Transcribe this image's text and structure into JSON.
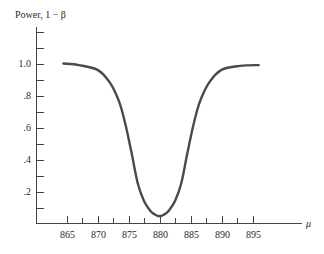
{
  "chart_data": {
    "type": "line",
    "title": "",
    "xlabel": "μ",
    "ylabel": "Power, 1 − β",
    "xlim": [
      860,
      902
    ],
    "ylim": [
      0,
      1.2
    ],
    "grid": false,
    "legend": null,
    "x_ticks": [
      865,
      870,
      875,
      880,
      885,
      890,
      895
    ],
    "x_tick_labels": [
      "865",
      "870",
      "875",
      "880",
      "885",
      "890",
      "895"
    ],
    "x_minor_ticks": [
      867.5,
      872.5,
      877.5,
      882.5,
      887.5,
      892.5
    ],
    "y_ticks": [
      0.1,
      0.2,
      0.3,
      0.4,
      0.5,
      0.6,
      0.7,
      0.8,
      0.9,
      1.0,
      1.1,
      1.2
    ],
    "y_tick_labels": [
      ".2",
      ".4",
      ".6",
      ".8",
      "1.0"
    ],
    "y_tick_label_values": [
      0.2,
      0.4,
      0.6,
      0.8,
      1.0
    ],
    "series": [
      {
        "name": "Power curve",
        "x": [
          864.5,
          867,
          870,
          872,
          873.5,
          874.5,
          875.5,
          876.5,
          877.5,
          878.5,
          879.3,
          880,
          880.7,
          881.5,
          882.5,
          883.5,
          884.5,
          885.5,
          886.5,
          888,
          890,
          893,
          896
        ],
        "y": [
          1.0,
          0.99,
          0.96,
          0.88,
          0.76,
          0.62,
          0.44,
          0.25,
          0.14,
          0.08,
          0.055,
          0.045,
          0.055,
          0.08,
          0.14,
          0.25,
          0.44,
          0.62,
          0.76,
          0.88,
          0.96,
          0.985,
          0.99
        ]
      }
    ]
  }
}
